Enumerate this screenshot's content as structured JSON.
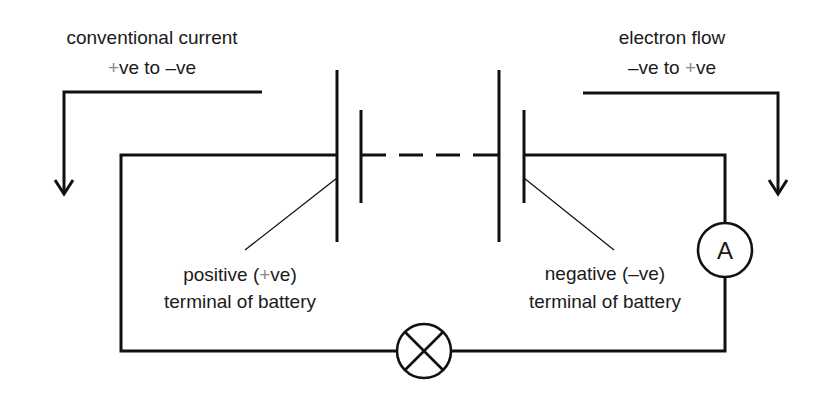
{
  "diagram": {
    "colors": {
      "line": "#111111",
      "text": "#1a1a1a",
      "plus_sign": "#8a8a8a",
      "background": "#ffffff"
    },
    "conventional_current": {
      "line1": "conventional current",
      "line2_plus": "+",
      "line2_mid": "ve to ",
      "line2_minus": "–",
      "line2_end": "ve",
      "arrow_direction": "down-left"
    },
    "electron_flow": {
      "line1": "electron flow",
      "line2_minus": "–",
      "line2_mid": "ve to ",
      "line2_plus": "+",
      "line2_end": "ve",
      "arrow_direction": "down-right"
    },
    "positive_terminal": {
      "line1_start": "positive (",
      "line1_plus": "+",
      "line1_end": "ve)",
      "line2": "terminal of battery"
    },
    "negative_terminal": {
      "line1": "negative (–ve)",
      "line2": "terminal of battery"
    },
    "ammeter": {
      "symbol": "A",
      "label": "ammeter"
    },
    "lamp": {
      "symbol": "lamp (circle with cross)"
    },
    "battery": {
      "cells": 2,
      "connection": "dashed (multiple cells)"
    }
  }
}
